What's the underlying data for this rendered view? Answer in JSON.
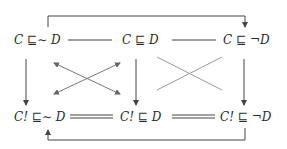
{
  "diagram": {
    "nodes": {
      "top_left": "C ⊑∼ D",
      "top_mid": "C ⊑ D",
      "top_right": "C ⊑ ¬D",
      "bot_left": "C! ⊑∼ D",
      "bot_mid": "C! ⊑ D",
      "bot_right": "C! ⊑ ¬D"
    },
    "colors": {
      "text": "#2a2a2a",
      "line": "#444444",
      "cross_line": "#999999"
    },
    "edges": [
      {
        "from": "top_left",
        "to": "top_mid",
        "style": "single-line"
      },
      {
        "from": "top_mid",
        "to": "top_right",
        "style": "single-line"
      },
      {
        "from": "bot_left",
        "to": "bot_mid",
        "style": "double-line"
      },
      {
        "from": "bot_mid",
        "to": "bot_right",
        "style": "double-line"
      },
      {
        "from": "top_left",
        "to": "bot_left",
        "style": "arrow"
      },
      {
        "from": "top_mid",
        "to": "bot_mid",
        "style": "arrow"
      },
      {
        "from": "top_right",
        "to": "bot_right",
        "style": "arrow"
      },
      {
        "from": "top_left",
        "to": "top_right",
        "style": "bracket-arrow-over"
      },
      {
        "from": "bot_right",
        "to": "bot_left",
        "style": "bracket-arrow-under"
      },
      {
        "from": "top_left",
        "to": "bot_mid",
        "style": "double-arrow-cross"
      },
      {
        "from": "top_mid",
        "to": "bot_left",
        "style": "double-arrow-cross"
      },
      {
        "from": "top_mid",
        "to": "bot_right",
        "style": "plain-cross"
      },
      {
        "from": "top_right",
        "to": "bot_mid",
        "style": "plain-cross"
      }
    ]
  }
}
